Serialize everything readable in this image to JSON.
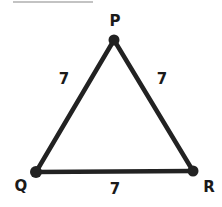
{
  "diagram": {
    "type": "triangle",
    "vertices": [
      {
        "id": "P",
        "label": "P"
      },
      {
        "id": "Q",
        "label": "Q"
      },
      {
        "id": "R",
        "label": "R"
      }
    ],
    "sides": [
      {
        "from": "P",
        "to": "Q",
        "label": "7"
      },
      {
        "from": "P",
        "to": "R",
        "label": "7"
      },
      {
        "from": "Q",
        "to": "R",
        "label": "7"
      }
    ],
    "colors": {
      "stroke": "#222222",
      "text": "#1a1a1a",
      "rule": "#888888"
    }
  }
}
